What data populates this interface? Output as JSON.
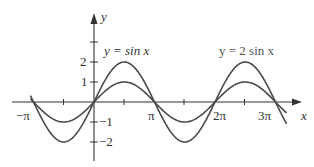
{
  "chart_data": {
    "type": "line",
    "title": "",
    "xlabel": "x",
    "ylabel": "y",
    "x_ticks": [
      "-π",
      "π",
      "2π",
      "3π"
    ],
    "y_ticks": [
      "2",
      "1",
      "-1",
      "-2"
    ],
    "xlim": [
      -3.45,
      3.45
    ],
    "x_range_radians": [
      -3.3,
      10.0
    ],
    "ylim": [
      -2.9,
      4.4
    ],
    "grid": false,
    "series": [
      {
        "name": "y = sin x",
        "function": "sin(x)",
        "amplitude": 1,
        "period": "2π"
      },
      {
        "name": "y = 2 sin x",
        "function": "2*sin(x)",
        "amplitude": 2,
        "period": "2π"
      }
    ],
    "annotations": [
      {
        "text": "y = sin x",
        "near": "first peak, left"
      },
      {
        "text": "y = 2 sin x",
        "near": "second peak, right"
      }
    ]
  },
  "labels": {
    "x_axis": "x",
    "y_axis": "y",
    "neg_pi": "−π",
    "pi": "π",
    "two_pi": "2π",
    "three_pi": "3π",
    "y2": "2",
    "y1": "1",
    "yneg1": "−1",
    "yneg2": "−2",
    "eq_sin": "y = sin x",
    "eq_2sin": "y = 2 sin x"
  }
}
